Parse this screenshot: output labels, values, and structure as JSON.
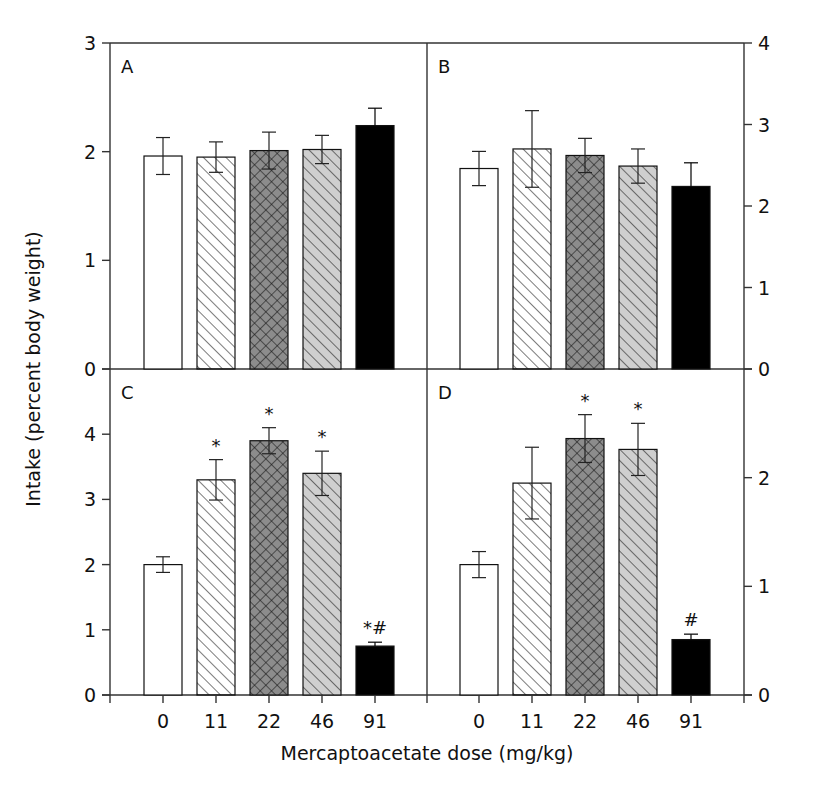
{
  "chart_data": {
    "type": "bar",
    "layout": "2x2 panels sharing x categories; left axis for A/C, right axis for B/D",
    "xlabel": "Mercaptoacetate dose (mg/kg)",
    "ylabel": "Intake (percent body weight)",
    "categories": [
      "0",
      "11",
      "22",
      "46",
      "91"
    ],
    "bar_styles": [
      {
        "dose": "0",
        "fill": "#ffffff",
        "pattern": "none"
      },
      {
        "dose": "11",
        "fill": "#ffffff",
        "pattern": "diagonal-hatch"
      },
      {
        "dose": "22",
        "fill": "#8c8c8c",
        "pattern": "crosshatch"
      },
      {
        "dose": "46",
        "fill": "#cfcfcf",
        "pattern": "diagonal-hatch"
      },
      {
        "dose": "91",
        "fill": "#000000",
        "pattern": "none"
      }
    ],
    "panels": [
      {
        "label": "A",
        "position": "top-left",
        "axis_side": "left",
        "ylim": [
          0,
          3
        ],
        "yticks": [
          0,
          1,
          2,
          3
        ],
        "values": [
          1.96,
          1.95,
          2.01,
          2.02,
          2.24
        ],
        "errors": [
          0.17,
          0.14,
          0.17,
          0.13,
          0.16
        ],
        "annotations": [
          "",
          "",
          "",
          "",
          ""
        ]
      },
      {
        "label": "B",
        "position": "top-right",
        "axis_side": "right",
        "ylim": [
          0,
          4
        ],
        "yticks": [
          0,
          1,
          2,
          3,
          4
        ],
        "values": [
          2.46,
          2.7,
          2.62,
          2.49,
          2.24
        ],
        "errors": [
          0.21,
          0.47,
          0.21,
          0.21,
          0.29
        ],
        "annotations": [
          "",
          "",
          "",
          "",
          ""
        ]
      },
      {
        "label": "C",
        "position": "bottom-left",
        "axis_side": "left",
        "ylim": [
          0,
          5
        ],
        "yticks": [
          0,
          1,
          2,
          3,
          4
        ],
        "values": [
          2.0,
          3.3,
          3.9,
          3.4,
          0.75
        ],
        "errors": [
          0.12,
          0.31,
          0.2,
          0.34,
          0.06
        ],
        "annotations": [
          "",
          "*",
          "*",
          "*",
          "*#"
        ]
      },
      {
        "label": "D",
        "position": "bottom-right",
        "axis_side": "right",
        "ylim": [
          0,
          3
        ],
        "yticks": [
          0,
          1,
          2
        ],
        "values": [
          1.2,
          1.95,
          2.36,
          2.26,
          0.51
        ],
        "errors": [
          0.12,
          0.33,
          0.22,
          0.24,
          0.05
        ],
        "annotations": [
          "",
          "",
          "*",
          "*",
          "#"
        ]
      }
    ]
  }
}
